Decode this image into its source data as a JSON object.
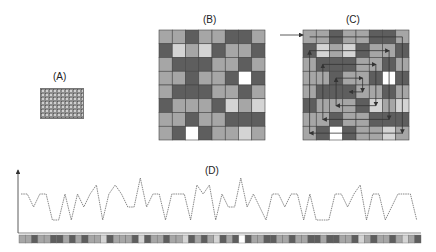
{
  "panels": {
    "a": {
      "label": "(A)"
    },
    "b": {
      "label": "(B)"
    },
    "c": {
      "label": "(C)"
    },
    "d": {
      "label": "(D)"
    }
  },
  "colors": {
    "M": "#a6a6a6",
    "D": "#5e5e5e",
    "L": "#d4d4d4",
    "W": "#ffffff",
    "grid_line": "#444444",
    "path_line": "#333333",
    "plot_line": "#555555"
  },
  "grid": [
    [
      "M",
      "M",
      "D",
      "M",
      "M",
      "D",
      "D",
      "M"
    ],
    [
      "D",
      "L",
      "M",
      "L",
      "D",
      "M",
      "M",
      "D"
    ],
    [
      "M",
      "D",
      "D",
      "D",
      "M",
      "M",
      "D",
      "M"
    ],
    [
      "M",
      "M",
      "D",
      "M",
      "M",
      "D",
      "W",
      "D"
    ],
    [
      "M",
      "D",
      "D",
      "D",
      "M",
      "M",
      "D",
      "M"
    ],
    [
      "D",
      "M",
      "M",
      "M",
      "D",
      "L",
      "M",
      "L"
    ],
    [
      "M",
      "M",
      "D",
      "M",
      "M",
      "D",
      "D",
      "D"
    ],
    [
      "M",
      "D",
      "W",
      "D",
      "M",
      "M",
      "L",
      "M"
    ]
  ],
  "chart_data": {
    "type": "line",
    "title": "(D)",
    "xlabel": "",
    "ylabel": "",
    "grid": false,
    "levels_legend": {
      "0": "low",
      "1": "mid",
      "2": "plateau",
      "3": "upper",
      "4": "peak"
    },
    "values": [
      2,
      2,
      1,
      2,
      2,
      0,
      0,
      2,
      0,
      2,
      1,
      2,
      3,
      0,
      2,
      3,
      2,
      1,
      1,
      4,
      1,
      2,
      2,
      0,
      2,
      2,
      2,
      0,
      3,
      2,
      3,
      0,
      2,
      1,
      1,
      4,
      1,
      2,
      1,
      0,
      2,
      2,
      1,
      2,
      2,
      0,
      2,
      0,
      0,
      0,
      2,
      2,
      1,
      2,
      3,
      0,
      2,
      2,
      0,
      1,
      2,
      2,
      2,
      0
    ],
    "strip": [
      "M",
      "M",
      "D",
      "M",
      "M",
      "D",
      "D",
      "M",
      "D",
      "M",
      "D",
      "M",
      "M",
      "L",
      "D",
      "M",
      "M",
      "M",
      "D",
      "L",
      "D",
      "M",
      "M",
      "D",
      "M",
      "M",
      "L",
      "D",
      "M",
      "D",
      "M",
      "L",
      "D",
      "M",
      "D",
      "W",
      "D",
      "M",
      "M",
      "D",
      "D",
      "M",
      "M",
      "D",
      "M",
      "M",
      "D",
      "D",
      "M",
      "D",
      "D",
      "M",
      "M",
      "D",
      "L",
      "M",
      "D",
      "M",
      "M",
      "D",
      "M",
      "L",
      "M",
      "D"
    ]
  }
}
